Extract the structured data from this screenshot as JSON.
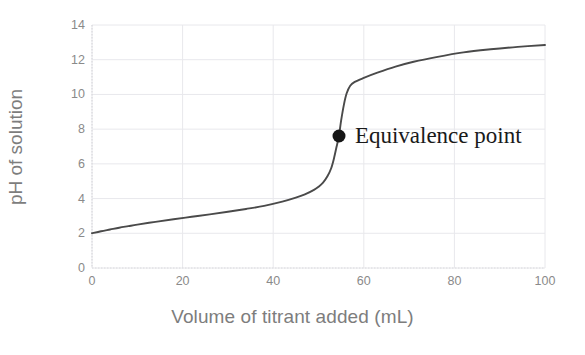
{
  "chart_data": {
    "type": "line",
    "title": "",
    "xlabel": "Volume of titrant added (mL)",
    "ylabel": "pH of solution",
    "xlim": [
      0,
      100
    ],
    "ylim": [
      0,
      14
    ],
    "xticks": [
      0,
      20,
      40,
      60,
      80,
      100
    ],
    "yticks": [
      0,
      2,
      4,
      6,
      8,
      10,
      12,
      14
    ],
    "grid": true,
    "legend": null,
    "series": [
      {
        "name": "Titration curve",
        "color": "#4a4a4a",
        "x": [
          0,
          2,
          4,
          6,
          8,
          10,
          14,
          18,
          22,
          26,
          30,
          34,
          38,
          42,
          45,
          47,
          49,
          50,
          51,
          52,
          52.8,
          53.4,
          54,
          54.5,
          55,
          55.6,
          56.2,
          57,
          58,
          60,
          63,
          67,
          71,
          76,
          82,
          88,
          94,
          100
        ],
        "y": [
          2.0,
          2.12,
          2.22,
          2.32,
          2.41,
          2.5,
          2.66,
          2.81,
          2.95,
          3.09,
          3.24,
          3.4,
          3.58,
          3.82,
          4.05,
          4.24,
          4.5,
          4.68,
          4.92,
          5.3,
          5.75,
          6.3,
          7.0,
          7.6,
          8.5,
          9.4,
          10.05,
          10.5,
          10.72,
          10.95,
          11.25,
          11.6,
          11.88,
          12.15,
          12.42,
          12.6,
          12.74,
          12.85
        ]
      }
    ],
    "annotations": [
      {
        "name": "equivalence-point",
        "label": "Equivalence point",
        "x": 54.5,
        "y": 7.6,
        "marker": "filled-circle",
        "marker_color": "#161616",
        "label_color": "#1a1a1a"
      }
    ],
    "style": {
      "background": "#ffffff",
      "grid_color": "#e8e8ec",
      "axis_color": "#d9d9dd",
      "tick_label_color": "#8a8a8a",
      "axis_title_color": "#7d7d7d"
    }
  }
}
